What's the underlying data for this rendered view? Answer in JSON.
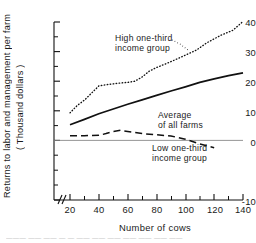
{
  "chart_data": {
    "type": "line",
    "title": "",
    "xlabel": "Number of cows",
    "ylabel": "Returns to labor and management per farm (Thousand dollars)",
    "ylabel_line1": "Returns  to  labor  and  management  per  farm",
    "ylabel_line2": "( Thousand  dollars )",
    "xlim": [
      15,
      140
    ],
    "ylim": [
      -10,
      40
    ],
    "grid": false,
    "legend_position": "inline-annotations",
    "axis_break": "x-axis broken near origin",
    "axis_break_symbol": "∕∕",
    "xticks": [
      20,
      40,
      60,
      80,
      100,
      120,
      140
    ],
    "xtick_labels": [
      "20",
      "40",
      "60",
      "80",
      "100",
      "120",
      "140"
    ],
    "x_minor_ticks": [
      30,
      50,
      70,
      90,
      110,
      130
    ],
    "yticks": [
      -10,
      0,
      10,
      20,
      30,
      40
    ],
    "ytick_labels": [
      "-10",
      "0",
      "10",
      "20",
      "30",
      "40"
    ],
    "y_minor_ticks": [
      -5,
      5,
      15,
      25,
      35
    ],
    "zero_line": 0,
    "series": [
      {
        "name": "High one-third income group",
        "style": "dotted",
        "color": "#111111",
        "x": [
          20,
          25,
          30,
          35,
          40,
          45,
          50,
          55,
          60,
          65,
          70,
          75,
          80,
          90,
          100,
          108,
          115,
          125,
          133,
          140
        ],
        "values": [
          9.3,
          11.8,
          13.6,
          16.0,
          18.4,
          18.8,
          19.1,
          19.4,
          19.6,
          20.0,
          21.4,
          23.4,
          24.6,
          26.6,
          28.8,
          30.6,
          33.0,
          35.6,
          37.2,
          40.2
        ]
      },
      {
        "name": "Average of all farms",
        "style": "solid",
        "color": "#111111",
        "x": [
          20,
          30,
          40,
          50,
          60,
          70,
          80,
          90,
          100,
          110,
          120,
          130,
          140
        ],
        "values": [
          5.3,
          7.1,
          9.0,
          10.6,
          12.2,
          13.7,
          15.2,
          16.7,
          18.1,
          19.6,
          20.8,
          21.9,
          22.8
        ]
      },
      {
        "name": "Low one-third income group",
        "style": "dashed",
        "color": "#111111",
        "x": [
          20,
          30,
          40,
          45,
          50,
          55,
          60,
          70,
          80,
          90,
          100,
          110,
          120
        ],
        "values": [
          1.6,
          1.6,
          1.7,
          2.3,
          3.0,
          3.4,
          3.0,
          2.3,
          1.9,
          1.5,
          0.4,
          -1.2,
          -2.5
        ]
      }
    ],
    "annotations": [
      {
        "name": "high-one-third-label",
        "lines": [
          "High  one-third",
          "income  group"
        ],
        "x_px": 115,
        "y_px": 33
      },
      {
        "name": "average-all-farms-label",
        "lines": [
          "Average",
          "of all farms"
        ],
        "x_px": 158,
        "y_px": 110
      },
      {
        "name": "low-one-third-label",
        "lines": [
          "Low  one-third",
          "income  group"
        ],
        "x_px": 152,
        "y_px": 143
      }
    ]
  },
  "caption": {
    "text": "———   ——  ——  —  —   ——    ——   ——  ——    ——   ——  ——"
  }
}
